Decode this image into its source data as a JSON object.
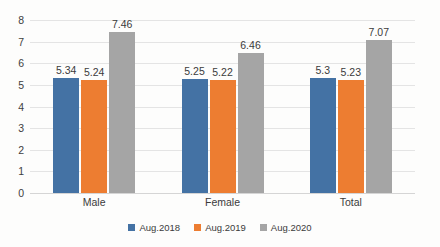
{
  "chart_data": {
    "type": "bar",
    "title": "",
    "subtitle": "",
    "xlabel": "",
    "ylabel": "",
    "categories": [
      "Male",
      "Female",
      "Total"
    ],
    "series": [
      {
        "name": "Aug.2018",
        "color": "#4472a4",
        "values": [
          5.34,
          5.25,
          5.3
        ]
      },
      {
        "name": "Aug.2019",
        "color": "#ed7d31",
        "values": [
          5.24,
          5.22,
          5.23
        ]
      },
      {
        "name": "Aug.2020",
        "color": "#a5a5a5",
        "values": [
          7.46,
          6.46,
          7.07
        ]
      }
    ],
    "data_labels": [
      [
        "5.34",
        "5.24",
        "7.46"
      ],
      [
        "5.25",
        "5.22",
        "6.46"
      ],
      [
        "5.3",
        "5.23",
        "7.07"
      ]
    ],
    "ylim": [
      0,
      8
    ],
    "ytick_step": 1,
    "ytick_labels": [
      "0",
      "1",
      "2",
      "3",
      "4",
      "5",
      "6",
      "7",
      "8"
    ],
    "grid": "horizontal",
    "legend_position": "bottom-center"
  }
}
